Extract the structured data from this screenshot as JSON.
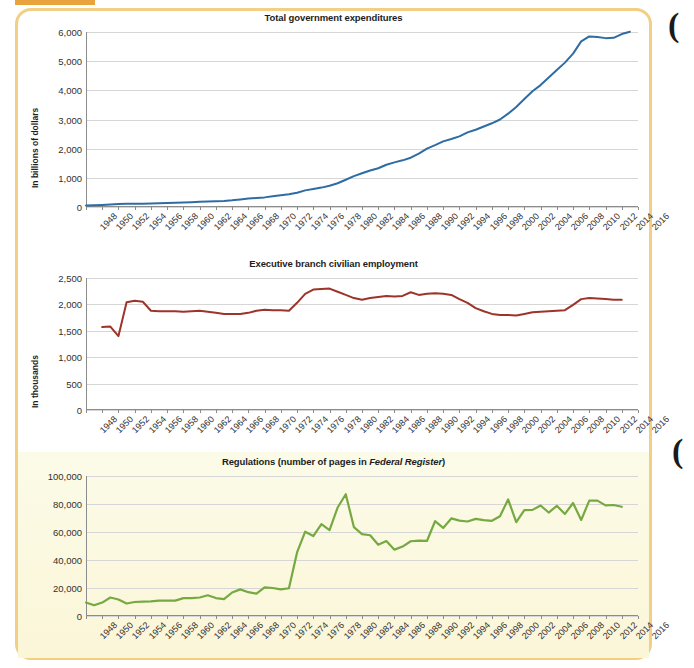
{
  "page": {
    "accent_orange": "#e8a33d",
    "panel_border": "#f2cf85",
    "edge_glyph_top": "(",
    "edge_glyph_mid": "("
  },
  "chart_data": [
    {
      "type": "line",
      "title": "Total government expenditures",
      "title_plain": "Total government expenditures",
      "xlabel": "",
      "ylabel": "In billions of dollars",
      "ylim": [
        0,
        6000
      ],
      "yticks": [
        "0",
        "1,000",
        "2,000",
        "3,000",
        "4,000",
        "5,000",
        "6,000"
      ],
      "ytick_values": [
        0,
        1000,
        2000,
        3000,
        4000,
        5000,
        6000
      ],
      "grid": true,
      "legend": "none",
      "color": "#2e6ca4",
      "xticks": [
        "1948",
        "1950",
        "1952",
        "1954",
        "1956",
        "1958",
        "1960",
        "1962",
        "1964",
        "1966",
        "1968",
        "1970",
        "1972",
        "1974",
        "1976",
        "1978",
        "1980",
        "1982",
        "1984",
        "1986",
        "1988",
        "1990",
        "1992",
        "1994",
        "1996",
        "1998",
        "2000",
        "2002",
        "2004",
        "2006",
        "2008",
        "2010",
        "2012",
        "2014",
        "2016"
      ],
      "x": [
        1948,
        1949,
        1950,
        1951,
        1952,
        1953,
        1954,
        1955,
        1956,
        1957,
        1958,
        1959,
        1960,
        1961,
        1962,
        1963,
        1964,
        1965,
        1966,
        1967,
        1968,
        1969,
        1970,
        1971,
        1972,
        1973,
        1974,
        1975,
        1976,
        1977,
        1978,
        1979,
        1980,
        1981,
        1982,
        1983,
        1984,
        1985,
        1986,
        1987,
        1988,
        1989,
        1990,
        1991,
        1992,
        1993,
        1994,
        1995,
        1996,
        1997,
        1998,
        1999,
        2000,
        2001,
        2002,
        2003,
        2004,
        2005,
        2006,
        2007,
        2008,
        2009,
        2010,
        2011,
        2012,
        2013,
        2014,
        2015
      ],
      "values": [
        55,
        60,
        70,
        85,
        105,
        115,
        110,
        115,
        120,
        130,
        140,
        150,
        155,
        165,
        180,
        190,
        200,
        210,
        230,
        260,
        290,
        310,
        330,
        365,
        400,
        435,
        490,
        570,
        615,
        665,
        730,
        815,
        935,
        1060,
        1155,
        1250,
        1330,
        1450,
        1530,
        1600,
        1690,
        1830,
        2000,
        2120,
        2250,
        2330,
        2420,
        2560,
        2650,
        2760,
        2870,
        3000,
        3200,
        3430,
        3700,
        3970,
        4180,
        4440,
        4700,
        4950,
        5260,
        5680,
        5850,
        5830,
        5790,
        5800,
        5930,
        6010
      ],
      "note": "values read from chart, in billions of dollars"
    },
    {
      "type": "line",
      "title": "Executive branch civilian employment",
      "title_plain": "Executive branch civilian employment",
      "xlabel": "",
      "ylabel": "In thousands",
      "ylim": [
        0,
        2500
      ],
      "yticks": [
        "0",
        "500",
        "1,000",
        "1,500",
        "2,000",
        "2,500"
      ],
      "ytick_values": [
        0,
        500,
        1000,
        1500,
        2000,
        2500
      ],
      "grid": true,
      "legend": "none",
      "color": "#9c342a",
      "xticks": [
        "1948",
        "1950",
        "1952",
        "1954",
        "1956",
        "1958",
        "1960",
        "1962",
        "1964",
        "1966",
        "1968",
        "1970",
        "1972",
        "1974",
        "1976",
        "1978",
        "1980",
        "1982",
        "1984",
        "1986",
        "1988",
        "1990",
        "1992",
        "1994",
        "1996",
        "1998",
        "2000",
        "2002",
        "2004",
        "2006",
        "2008",
        "2010",
        "2012",
        "2014",
        "2016"
      ],
      "x": [
        1950,
        1951,
        1952,
        1953,
        1954,
        1955,
        1956,
        1957,
        1958,
        1959,
        1960,
        1961,
        1962,
        1963,
        1964,
        1965,
        1966,
        1967,
        1968,
        1969,
        1970,
        1971,
        1972,
        1973,
        1974,
        1975,
        1976,
        1977,
        1978,
        1979,
        1980,
        1981,
        1982,
        1983,
        1984,
        1985,
        1986,
        1987,
        1988,
        1989,
        1990,
        1991,
        1992,
        1993,
        1994,
        1995,
        1996,
        1997,
        1998,
        1999,
        2000,
        2001,
        2002,
        2003,
        2004,
        2005,
        2006,
        2007,
        2008,
        2009,
        2010,
        2011,
        2012,
        2013,
        2014
      ],
      "values": [
        1570,
        1580,
        1400,
        2040,
        2070,
        2050,
        1880,
        1870,
        1870,
        1870,
        1860,
        1870,
        1880,
        1860,
        1840,
        1820,
        1820,
        1820,
        1840,
        1880,
        1900,
        1890,
        1890,
        1880,
        2030,
        2200,
        2280,
        2290,
        2300,
        2240,
        2180,
        2120,
        2090,
        2120,
        2140,
        2160,
        2150,
        2160,
        2230,
        2180,
        2200,
        2210,
        2200,
        2180,
        2100,
        2030,
        1930,
        1870,
        1820,
        1800,
        1800,
        1790,
        1820,
        1850,
        1860,
        1870,
        1880,
        1890,
        1990,
        2100,
        2120,
        2110,
        2100,
        2090,
        2090
      ],
      "note": "values read from chart, in thousands of employees"
    },
    {
      "type": "line",
      "title": "Regulations (number of pages in Federal Register)",
      "title_prefix": "Regulations (number of pages in ",
      "title_italic": "Federal Register",
      "title_suffix": ")",
      "xlabel": "",
      "ylabel": "",
      "ylim": [
        0,
        100000
      ],
      "yticks": [
        "0",
        "20,000",
        "40,000",
        "60,000",
        "80,000",
        "100,000"
      ],
      "ytick_values": [
        0,
        20000,
        40000,
        60000,
        80000,
        100000
      ],
      "grid": true,
      "legend": "none",
      "color": "#76a942",
      "background": "#fbf8dd",
      "xticks": [
        "1948",
        "1950",
        "1952",
        "1954",
        "1956",
        "1958",
        "1960",
        "1962",
        "1964",
        "1966",
        "1968",
        "1970",
        "1972",
        "1974",
        "1976",
        "1978",
        "1980",
        "1982",
        "1984",
        "1986",
        "1988",
        "1990",
        "1992",
        "1994",
        "1996",
        "1998",
        "2000",
        "2002",
        "2004",
        "2006",
        "2008",
        "2010",
        "2012",
        "2014",
        "2016"
      ],
      "x": [
        1948,
        1949,
        1950,
        1951,
        1952,
        1953,
        1954,
        1955,
        1956,
        1957,
        1958,
        1959,
        1960,
        1961,
        1962,
        1963,
        1964,
        1965,
        1966,
        1967,
        1968,
        1969,
        1970,
        1971,
        1972,
        1973,
        1974,
        1975,
        1976,
        1977,
        1978,
        1979,
        1980,
        1981,
        1982,
        1983,
        1984,
        1985,
        1986,
        1987,
        1988,
        1989,
        1990,
        1991,
        1992,
        1993,
        1994,
        1995,
        1996,
        1997,
        1998,
        1999,
        2000,
        2001,
        2002,
        2003,
        2004,
        2005,
        2006,
        2007,
        2008,
        2009,
        2010,
        2011,
        2012,
        2013,
        2014
      ],
      "values": [
        9600,
        7700,
        9600,
        13200,
        11800,
        8900,
        10000,
        10200,
        10500,
        11000,
        11000,
        11000,
        12800,
        12800,
        13200,
        14800,
        12800,
        12000,
        16800,
        19000,
        17000,
        16000,
        20500,
        20000,
        19000,
        19800,
        45400,
        60200,
        57100,
        65600,
        61300,
        77500,
        87000,
        63500,
        58500,
        57700,
        50900,
        53500,
        47400,
        49600,
        53400,
        53800,
        53600,
        67700,
        62900,
        69700,
        68100,
        67500,
        69400,
        68500,
        68000,
        71200,
        83300,
        67000,
        75600,
        75800,
        78900,
        73900,
        78700,
        72900,
        80700,
        68600,
        82400,
        82400,
        79000,
        79300,
        78000
      ],
      "note": "pages published in the Federal Register per year"
    }
  ]
}
